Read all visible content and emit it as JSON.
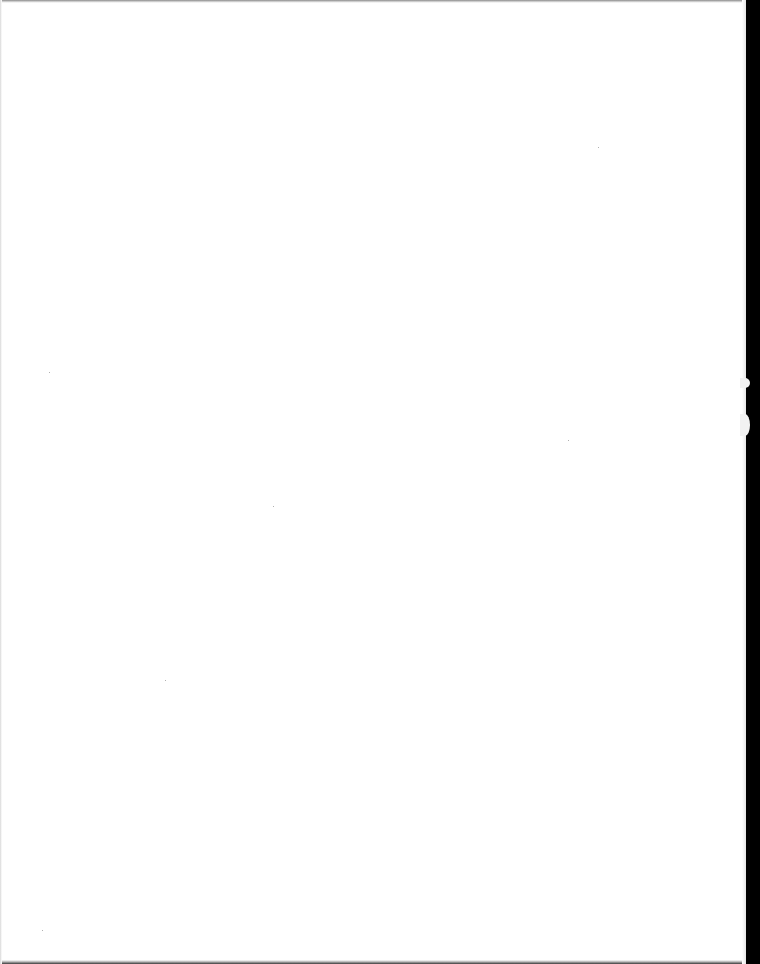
{
  "page": {
    "kind": "blank scanned page",
    "text": "",
    "colors": {
      "paper": "#ffffff",
      "scanner_background": "#000000",
      "edge_shadow": "#8a8a8a",
      "speck": "#b0b0b0"
    }
  }
}
